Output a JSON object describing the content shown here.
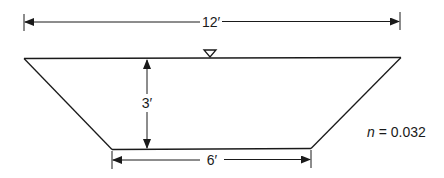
{
  "diagram": {
    "type": "trapezoidal-channel-cross-section",
    "top_width_label": "12′",
    "depth_label": "3′",
    "bottom_width_label": "6′",
    "roughness": {
      "symbol": "n",
      "equals": " = ",
      "value": "0.032"
    },
    "water_surface_symbol": "inverted-triangle",
    "line_color": "#1a1a1a"
  }
}
